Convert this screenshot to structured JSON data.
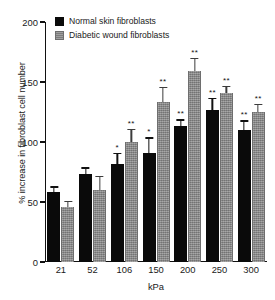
{
  "chart_data": {
    "type": "bar",
    "title": "",
    "xlabel": "kPa",
    "ylabel": "% increase in fibroblast cell number",
    "categories": [
      "21",
      "52",
      "106",
      "150",
      "200",
      "250",
      "300"
    ],
    "ylim": [
      0,
      200
    ],
    "yticks": [
      0,
      50,
      100,
      150,
      200
    ],
    "ytick_labels": [
      "0",
      "50",
      "100",
      "150",
      "200"
    ],
    "grid": false,
    "legend_position": "top-left",
    "series": [
      {
        "name": "Normal skin fibroblasts",
        "color": "#0a0a0a",
        "values": [
          58,
          73,
          82,
          91,
          113,
          127,
          110
        ],
        "errors": [
          5,
          6,
          9,
          13,
          6,
          10,
          8
        ],
        "significance": [
          "",
          "",
          "*",
          "*",
          "**",
          "**",
          "**"
        ]
      },
      {
        "name": "Diabetic wound fibroblasts",
        "color": "#8a8a8a",
        "values": [
          46,
          60,
          100,
          133,
          159,
          141,
          125
        ],
        "errors": [
          5,
          12,
          11,
          13,
          11,
          6,
          7
        ],
        "significance": [
          "",
          "",
          "**",
          "**",
          "**",
          "**",
          "**"
        ]
      }
    ]
  },
  "legend": {
    "items": [
      {
        "label": "Normal skin fibroblasts"
      },
      {
        "label": "Diabetic wound fibroblasts"
      }
    ]
  }
}
